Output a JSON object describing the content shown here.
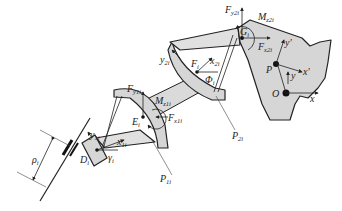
{
  "figure": {
    "type": "mechanism-diagram",
    "fill_color": "#d6d6d6",
    "stroke_color": "#222222"
  },
  "labels": {
    "Fy2i": {
      "main": "F",
      "sub": "y2i"
    },
    "Mz2i": {
      "main": "M",
      "sub": "z2i"
    },
    "Gi": {
      "main": "G",
      "sub": "i"
    },
    "Fx2i": {
      "main": "F",
      "sub": "x2i"
    },
    "y_prime": {
      "main": "y'",
      "sub": ""
    },
    "x_prime": {
      "main": "x'",
      "sub": ""
    },
    "P": {
      "main": "P",
      "sub": ""
    },
    "y": {
      "main": "y",
      "sub": ""
    },
    "O": {
      "main": "O",
      "sub": ""
    },
    "x": {
      "main": "x",
      "sub": ""
    },
    "y2i": {
      "main": "y",
      "sub": "2i"
    },
    "Fi": {
      "main": "F",
      "sub": "i"
    },
    "x2i": {
      "main": "x",
      "sub": "2i"
    },
    "Phi": {
      "main": "Φ",
      "sub": "i"
    },
    "P2i": {
      "main": "P",
      "sub": "2i"
    },
    "Fy1i": {
      "main": "F",
      "sub": "y1i"
    },
    "Mz1i": {
      "main": "M",
      "sub": "z1i"
    },
    "Ei": {
      "main": "E",
      "sub": "i"
    },
    "Fx1i": {
      "main": "F",
      "sub": "x1i"
    },
    "y1i": {
      "main": "y",
      "sub": "1i"
    },
    "x1i": {
      "main": "x",
      "sub": "1i"
    },
    "Di": {
      "main": "D",
      "sub": "i"
    },
    "gamma": {
      "main": "γ",
      "sub": "i"
    },
    "P1i": {
      "main": "P",
      "sub": "1i"
    },
    "rho": {
      "main": "ρ",
      "sub": "i"
    }
  }
}
